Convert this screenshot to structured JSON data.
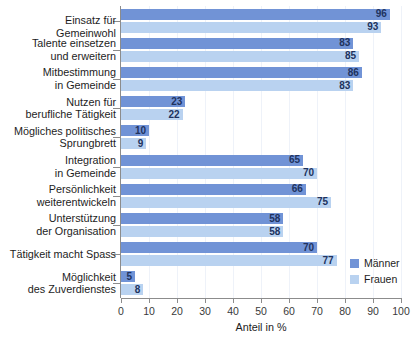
{
  "chart_data": {
    "type": "bar",
    "orientation": "horizontal",
    "title": "",
    "xlabel": "Anteil in %",
    "ylabel": "",
    "xlim": [
      0,
      100
    ],
    "xticks": [
      0,
      10,
      20,
      30,
      40,
      50,
      60,
      70,
      80,
      90,
      100
    ],
    "xticklabels": [
      "0",
      "10",
      "20",
      "30",
      "40",
      "50",
      "60",
      "70",
      "80",
      "90",
      "100"
    ],
    "grid": true,
    "grid_axis": "x",
    "legend_position": "lower right",
    "categories": [
      "Einsatz für Gemeinwohl",
      "Talente einsetzen\nund erweitern",
      "Mitbestimmung\nin Gemeinde",
      "Nutzen für\nberufliche Tätigkeit",
      "Mögliches politisches\nSprungbrett",
      "Integration\nin Gemeinde",
      "Persönlichkeit\nweiterentwickeln",
      "Unterstützung\nder Organisation",
      "Tätigkeit macht Spass",
      "Möglichkeit\ndes Zuverdienstes"
    ],
    "series": [
      {
        "name": "Männer",
        "color": "#7193d6",
        "values": [
          96,
          83,
          86,
          23,
          10,
          65,
          66,
          58,
          70,
          5
        ]
      },
      {
        "name": "Frauen",
        "color": "#b9d2f0",
        "values": [
          93,
          85,
          83,
          22,
          9,
          70,
          75,
          58,
          77,
          8
        ]
      }
    ]
  },
  "legend": {
    "items": [
      {
        "label": "Männer",
        "color": "#7193d6"
      },
      {
        "label": "Frauen",
        "color": "#b9d2f0"
      }
    ]
  },
  "axis": {
    "x_title": "Anteil in %"
  }
}
